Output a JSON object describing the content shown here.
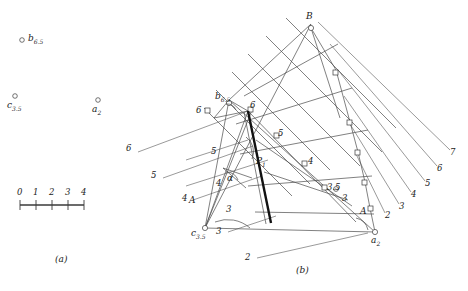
{
  "figure": {
    "background": "#ffffff",
    "ink": "#333333",
    "width": 468,
    "height": 291
  },
  "panel_a": {
    "caption": "(a)",
    "points": [
      {
        "name": "b",
        "sub": "6.5",
        "x": 22,
        "y": 40
      },
      {
        "name": "c",
        "sub": "3.5",
        "x": 15,
        "y": 96
      },
      {
        "name": "a",
        "sub": "2",
        "x": 98,
        "y": 100
      }
    ],
    "scale_bar": {
      "ticks": [
        "0",
        "1",
        "2",
        "3",
        "4"
      ],
      "x_start": 20,
      "x_end": 84,
      "y": 205
    }
  },
  "panel_b": {
    "caption": "(b)",
    "vertices": [
      {
        "label": "B",
        "sub": "",
        "x": 311,
        "y": 24
      },
      {
        "label": "b",
        "sub": "6.5",
        "x": 229,
        "y": 100
      },
      {
        "label": "c",
        "sub": "3.5",
        "x": 205,
        "y": 228
      },
      {
        "label": "a",
        "sub": "2",
        "x": 375,
        "y": 232
      }
    ],
    "node_labels": [
      {
        "text": "6",
        "x": 200,
        "y": 112
      },
      {
        "text": "6",
        "x": 253,
        "y": 107
      },
      {
        "text": "5",
        "x": 281,
        "y": 135
      },
      {
        "text": "5",
        "x": 214,
        "y": 153
      },
      {
        "text": "4",
        "x": 311,
        "y": 163
      },
      {
        "text": "4",
        "x": 219,
        "y": 185
      },
      {
        "text": "3.5",
        "x": 331,
        "y": 189
      },
      {
        "text": "3",
        "x": 345,
        "y": 200
      },
      {
        "text": "3",
        "x": 229,
        "y": 211
      },
      {
        "text": "A",
        "x": 363,
        "y": 213
      },
      {
        "text": "A",
        "x": 192,
        "y": 202
      }
    ],
    "left_ray_labels": [
      {
        "text": "6",
        "x": 129,
        "y": 150
      },
      {
        "text": "5",
        "x": 154,
        "y": 177
      },
      {
        "text": "4",
        "x": 185,
        "y": 200
      },
      {
        "text": "3",
        "x": 219,
        "y": 233
      },
      {
        "text": "2",
        "x": 248,
        "y": 259
      }
    ],
    "right_ray_labels": [
      {
        "text": "7",
        "x": 453,
        "y": 154
      },
      {
        "text": "6",
        "x": 440,
        "y": 170
      },
      {
        "text": "5",
        "x": 428,
        "y": 185
      },
      {
        "text": "4",
        "x": 414,
        "y": 196
      },
      {
        "text": "3",
        "x": 402,
        "y": 208
      },
      {
        "text": "2",
        "x": 388,
        "y": 217
      }
    ],
    "annotations": [
      {
        "text": "P",
        "sub": "1",
        "x": 259,
        "y": 163,
        "style": "italic"
      },
      {
        "text": "α",
        "sub": "",
        "x": 230,
        "y": 180,
        "style": "greek"
      }
    ],
    "highlighted_segment": {
      "name": "P1-line",
      "from_x": 248,
      "from_y": 111,
      "to_x": 271,
      "to_y": 223,
      "width": 2.4
    }
  }
}
